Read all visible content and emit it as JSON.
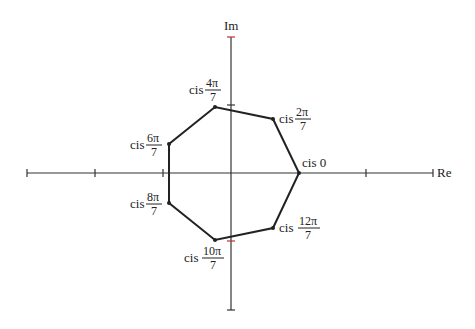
{
  "axes": {
    "x_label": "Re",
    "y_label": "Im"
  },
  "vertices": [
    {
      "label": "cis 0",
      "num": "",
      "den": ""
    },
    {
      "label": "cis",
      "num": "2π",
      "den": "7"
    },
    {
      "label": "cis",
      "num": "4π",
      "den": "7"
    },
    {
      "label": "cis",
      "num": "6π",
      "den": "7"
    },
    {
      "label": "cis",
      "num": "8π",
      "den": "7"
    },
    {
      "label": "cis",
      "num": "10π",
      "den": "7"
    },
    {
      "label": "cis",
      "num": "12π",
      "den": "7"
    }
  ]
}
